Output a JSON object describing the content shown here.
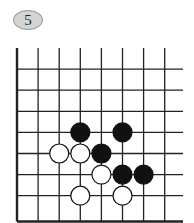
{
  "diagram": {
    "problem_number": "5",
    "board": {
      "columns": 8,
      "rows": 8,
      "edges": [
        "left",
        "bottom"
      ],
      "open_edges": [
        "top",
        "right"
      ]
    },
    "stones": [
      {
        "color": "black",
        "col": 3,
        "row": 4
      },
      {
        "color": "black",
        "col": 5,
        "row": 4
      },
      {
        "color": "white",
        "col": 2,
        "row": 5
      },
      {
        "color": "white",
        "col": 3,
        "row": 5
      },
      {
        "color": "black",
        "col": 4,
        "row": 5
      },
      {
        "color": "white",
        "col": 4,
        "row": 6
      },
      {
        "color": "black",
        "col": 5,
        "row": 6
      },
      {
        "color": "black",
        "col": 6,
        "row": 6
      },
      {
        "color": "white",
        "col": 3,
        "row": 7
      },
      {
        "color": "white",
        "col": 5,
        "row": 7
      }
    ],
    "colors": {
      "black_stone": "#111111",
      "white_stone": "#ffffff",
      "grid_line": "#222222",
      "badge_fill": "#d4d4d4"
    }
  }
}
